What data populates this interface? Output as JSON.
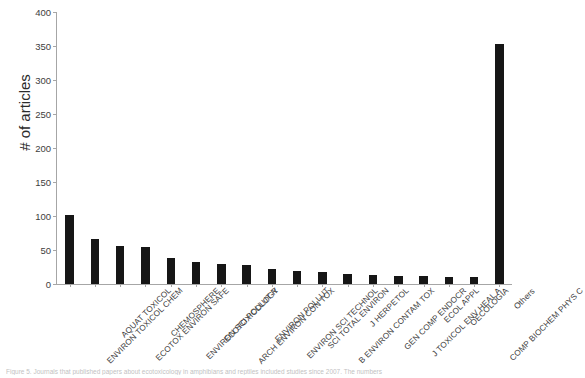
{
  "chart_data": {
    "type": "bar",
    "title": "",
    "xlabel": "",
    "ylabel": "# of articles",
    "ylim": [
      0,
      400
    ],
    "yticks": [
      0,
      50,
      100,
      150,
      200,
      250,
      300,
      350,
      400
    ],
    "grid": false,
    "legend": null,
    "categories": [
      "ENVIRON TOXICOL CHEM",
      "AQUAT TOXICOL",
      "ECOTOX ENVIRON SAFE",
      "CHEMOSPHERE",
      "ENVIRON SCI POLLUT R",
      "ECOTOXICOLOGY",
      "ARCH ENVIRON CON TOX",
      "ENVIRON POLLUT",
      "ENVIRON SCI TECHNOL",
      "SCI TOTAL ENVIRON",
      "B ENVIRON CONTAM TOX",
      "J HERPETOL",
      "GEN COMP ENDOCR",
      "J TOXICOL ENV HEAL A",
      "ECOL APPL",
      "OECOLOGIA",
      "COMP BIOCHEM PHYS C",
      "Others"
    ],
    "values": [
      102,
      66,
      56,
      55,
      38,
      33,
      30,
      28,
      22,
      19,
      17,
      14,
      13,
      12,
      12,
      11,
      10,
      353
    ]
  },
  "caption": {
    "text": "Figure 5. Journals that published papers about ecotoxicology in amphibians and reptiles included studies since 2007. The numbers"
  }
}
